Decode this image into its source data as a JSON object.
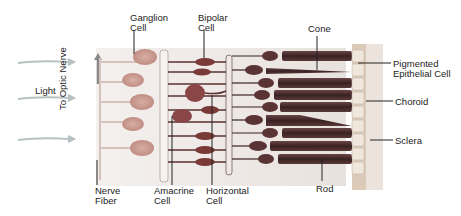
{
  "diagram": {
    "type": "retina-cross-section",
    "labels": {
      "ganglion": [
        "Ganglion",
        "Cell"
      ],
      "bipolar": [
        "Bipolar",
        "Cell"
      ],
      "cone": "Cone",
      "pigmented": [
        "Pigmented",
        "Epithelial Cell"
      ],
      "choroid": "Choroid",
      "sclera": "Sclera",
      "light": "Light",
      "optic_nerve": "To Optic Nerve",
      "nerve_fiber": [
        "Nerve",
        "Fiber"
      ],
      "amacrine": [
        "Amacrine",
        "Cell"
      ],
      "horizontal": [
        "Horizontal",
        "Cell"
      ],
      "rod": "Rod"
    },
    "colors": {
      "ganglion": "#c99a90",
      "bipolar": "#7a3a38",
      "photoreceptor": "#4a2a2a",
      "epithelium": "#e6d6c8",
      "choroid": "#d8c2b0",
      "sclera": "#ece6e0",
      "arrow": "#b8c0c0"
    }
  }
}
